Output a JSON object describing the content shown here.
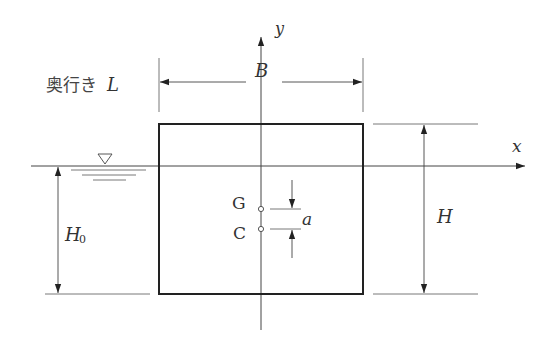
{
  "diagram": {
    "labels": {
      "depth": "奥行き",
      "depth_symbol": "L",
      "width": "B",
      "height": "H",
      "draft": "H",
      "draft_subscript": "0",
      "gravity_center": "G",
      "buoyancy_center": "C",
      "offset": "a",
      "x_axis": "x",
      "y_axis": "y"
    },
    "water_surface_symbol": "▽",
    "colors": {
      "line": "#222222",
      "thin_line": "#555555",
      "text": "#333333"
    }
  }
}
